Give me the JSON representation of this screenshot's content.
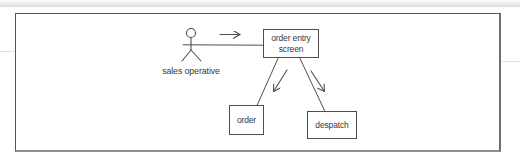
{
  "figure": {
    "type": "dataflow-diagram",
    "actor": {
      "label": "sales operative"
    },
    "nodes": {
      "order_entry_screen": {
        "label": "order entry screen"
      },
      "order": {
        "label": "order"
      },
      "despatch": {
        "label": "despatch"
      }
    },
    "connections": [
      {
        "from": "sales operative",
        "to": "order entry screen",
        "direction": "right"
      },
      {
        "from": "order entry screen",
        "to": "order",
        "direction": "down-left"
      },
      {
        "from": "order entry screen",
        "to": "despatch",
        "direction": "down-right"
      }
    ],
    "colors": {
      "line": "#4f4f4f",
      "text": "#383838",
      "frame": "#565656",
      "background": "#ffffff"
    }
  }
}
